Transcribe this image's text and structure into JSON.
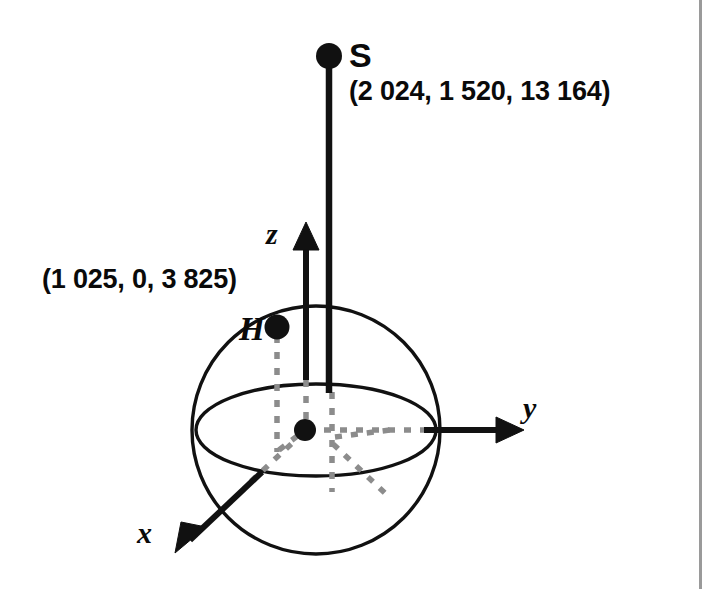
{
  "figure": {
    "type": "3d-coordinate-sphere-diagram",
    "background_color": "#ffffff",
    "ink_color": "#111111",
    "dash_color": "#8c8c8c",
    "rule_color": "#9a9a9a"
  },
  "points": {
    "satellite": {
      "id": "S",
      "label": "S",
      "coordinates_text": "(2 024, 1 520, 13 164)",
      "x": 2024,
      "y": 1520,
      "z": 13164
    },
    "station": {
      "id": "H",
      "label": "H",
      "coordinates_text": "(1 025, 0, 3 825)",
      "x": 1025,
      "y": 0,
      "z": 3825
    }
  },
  "axes": {
    "x": {
      "label": "x",
      "direction": "down-left"
    },
    "y": {
      "label": "y",
      "direction": "right"
    },
    "z": {
      "label": "z",
      "direction": "up"
    }
  },
  "sphere": {
    "center_px": [
      316,
      430
    ],
    "radius_px": 124,
    "equator_ellipse_rx": 120,
    "equator_ellipse_ry": 46
  }
}
